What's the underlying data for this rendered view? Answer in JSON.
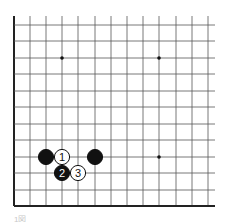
{
  "board": {
    "grid": {
      "x_lines": [
        14,
        30,
        46,
        62,
        78,
        95,
        111,
        127,
        143,
        159,
        176,
        192,
        208
      ],
      "y_lines": [
        25,
        41,
        58,
        74,
        91,
        107,
        124,
        140,
        157,
        173,
        190,
        206
      ],
      "x_extent": [
        14,
        215
      ],
      "y_extent": [
        16,
        206
      ],
      "line_color": "#555555",
      "edge_color": "#222222"
    },
    "star_points": [
      {
        "x": 62,
        "y": 58
      },
      {
        "x": 159,
        "y": 58
      },
      {
        "x": 159,
        "y": 157
      }
    ],
    "stones": [
      {
        "color": "black",
        "x": 46,
        "y": 157,
        "label": ""
      },
      {
        "color": "white",
        "x": 62,
        "y": 157,
        "label": "1"
      },
      {
        "color": "black",
        "x": 95,
        "y": 157,
        "label": ""
      },
      {
        "color": "black",
        "x": 62,
        "y": 173,
        "label": "2"
      },
      {
        "color": "white",
        "x": 78,
        "y": 173,
        "label": "3"
      }
    ]
  },
  "caption": "1図"
}
